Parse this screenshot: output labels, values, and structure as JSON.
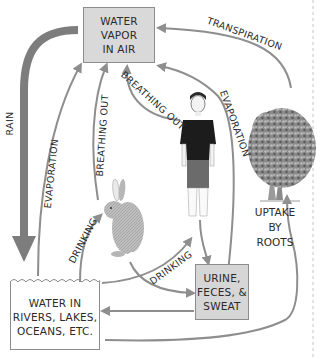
{
  "diagram": {
    "nodes": {
      "vapor": {
        "lines": [
          "WATER",
          "VAPOR",
          "IN AIR"
        ]
      },
      "urine": {
        "lines": [
          "URINE,",
          "FECES, &",
          "SWEAT"
        ]
      },
      "water_body": {
        "lines": [
          "WATER IN",
          "RIVERS, LAKES,",
          "OCEANS, ETC."
        ]
      },
      "roots": {
        "lines": [
          "UPTAKE",
          "BY",
          "ROOTS"
        ]
      }
    },
    "organisms": [
      {
        "name": "human",
        "icon": "human-figure-icon"
      },
      {
        "name": "rabbit",
        "icon": "rabbit-icon"
      },
      {
        "name": "tree",
        "icon": "tree-icon"
      }
    ],
    "arrow_labels": {
      "rain": "RAIN",
      "evaporation_water": "EVAPORATION",
      "breathing_out_rabbit": "BREATHING OUT",
      "breathing_out_human": "BREATHING OUT",
      "evaporation_human": "EVAPORATION",
      "transpiration": "TRANSPIRATION",
      "drinking_rabbit": "DRINKING",
      "drinking_human": "DRINKING"
    },
    "colors": {
      "arrow": "#8e8e8e",
      "rain_arrow": "#7d7d7d",
      "box_fill": "#d9d9d9",
      "box_border": "#8c8c8c",
      "text": "#2a2a2a"
    }
  }
}
